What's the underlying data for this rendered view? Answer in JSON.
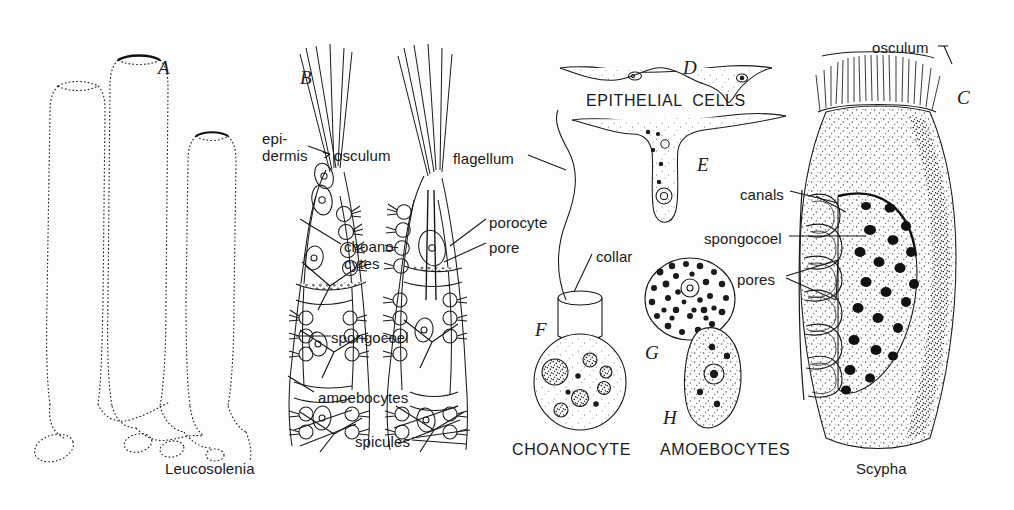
{
  "figure": {
    "background_color": "#fdfdfd",
    "ink_color": "#1a1a1a",
    "width": 1014,
    "height": 510
  },
  "panel_letters": [
    {
      "id": "A",
      "label": "A",
      "x": 158,
      "y": 58,
      "subject": "Leucosolenia colony habit"
    },
    {
      "id": "B",
      "label": "B",
      "x": 300,
      "y": 68,
      "subject": "Leucosolenia tube section"
    },
    {
      "id": "C",
      "label": "C",
      "x": 957,
      "y": 88,
      "subject": "Scypha whole animal"
    },
    {
      "id": "D",
      "label": "D",
      "x": 683,
      "y": 58,
      "subject": "Flat epithelial cell"
    },
    {
      "id": "E",
      "label": "E",
      "x": 697,
      "y": 155,
      "subject": "Epithelial cell with process"
    },
    {
      "id": "F",
      "label": "F",
      "x": 535,
      "y": 320,
      "subject": "Choanocyte"
    },
    {
      "id": "G",
      "label": "G",
      "x": 645,
      "y": 343,
      "subject": "Amoebocyte granular"
    },
    {
      "id": "H",
      "label": "H",
      "x": 663,
      "y": 408,
      "subject": "Amoebocyte nucleated"
    }
  ],
  "labels": [
    {
      "name": "epidermis",
      "text": "epi-\ndermis",
      "x": 262,
      "y": 130,
      "align": "left",
      "style": "two-line"
    },
    {
      "name": "osculum-b",
      "text": "osculum",
      "x": 334,
      "y": 148,
      "align": "left",
      "style": "plain"
    },
    {
      "name": "choanocytes",
      "text": "choano-\ncytes",
      "x": 344,
      "y": 238,
      "align": "left",
      "style": "two-line"
    },
    {
      "name": "spongocoel-b",
      "text": "spongocoel",
      "x": 331,
      "y": 330,
      "align": "left",
      "style": "plain"
    },
    {
      "name": "amoebocytes-b",
      "text": "amoebocytes",
      "x": 318,
      "y": 390,
      "align": "left",
      "style": "plain"
    },
    {
      "name": "spicules",
      "text": "spicules",
      "x": 355,
      "y": 434,
      "align": "left",
      "style": "plain"
    },
    {
      "name": "porocyte",
      "text": "porocyte",
      "x": 489,
      "y": 215,
      "align": "left",
      "style": "plain"
    },
    {
      "name": "pore",
      "text": "pore",
      "x": 489,
      "y": 240,
      "align": "left",
      "style": "plain"
    },
    {
      "name": "flagellum",
      "text": "flagellum",
      "x": 453,
      "y": 151,
      "align": "left",
      "style": "plain"
    },
    {
      "name": "collar",
      "text": "collar",
      "x": 596,
      "y": 249,
      "align": "left",
      "style": "plain"
    },
    {
      "name": "canals",
      "text": "canals",
      "x": 740,
      "y": 187,
      "align": "left",
      "style": "plain"
    },
    {
      "name": "spongocoel-c",
      "text": "spongocoel",
      "x": 704,
      "y": 231,
      "align": "left",
      "style": "plain"
    },
    {
      "name": "pores",
      "text": "pores",
      "x": 737,
      "y": 272,
      "align": "left",
      "style": "plain"
    },
    {
      "name": "osculum-c",
      "text": "osculum",
      "x": 872,
      "y": 40,
      "align": "left",
      "style": "plain"
    }
  ],
  "captions": [
    {
      "name": "epithelial-cells-caption",
      "text": "EPITHELIAL  CELLS",
      "x": 586,
      "y": 92,
      "style": "caps"
    },
    {
      "name": "choanocyte-caption",
      "text": "CHOANOCYTE",
      "x": 512,
      "y": 441,
      "style": "caps"
    },
    {
      "name": "amoebocytes-caption",
      "text": "AMOEBOCYTES",
      "x": 660,
      "y": 441,
      "style": "caps"
    },
    {
      "name": "leucosolenia-caption",
      "text": "Leucosolenia",
      "x": 165,
      "y": 461,
      "style": "species"
    },
    {
      "name": "scypha-caption",
      "text": "Scypha",
      "x": 856,
      "y": 461,
      "style": "species"
    }
  ],
  "leader_lines": [
    {
      "name": "leader-epidermis",
      "from": [
        308,
        146
      ],
      "to": [
        330,
        153
      ]
    },
    {
      "name": "leader-choanocytes",
      "from": [
        341,
        248
      ],
      "to": [
        300,
        222
      ]
    },
    {
      "name": "leader-spongocoel-b",
      "from": [
        329,
        337
      ],
      "to": [
        296,
        337
      ]
    },
    {
      "name": "leader-amoebocytes",
      "from": [
        316,
        396
      ],
      "to": [
        288,
        378
      ]
    },
    {
      "name": "leader-spicules",
      "from": [
        412,
        440
      ],
      "to": [
        470,
        432
      ]
    },
    {
      "name": "leader-porocyte",
      "from": [
        487,
        222
      ],
      "to": [
        452,
        248
      ]
    },
    {
      "name": "leader-pore",
      "from": [
        487,
        246
      ],
      "to": [
        448,
        262
      ]
    },
    {
      "name": "leader-flagellum",
      "from": [
        528,
        158
      ],
      "to": [
        565,
        172
      ]
    },
    {
      "name": "leader-collar",
      "from": [
        594,
        256
      ],
      "to": [
        578,
        286
      ]
    },
    {
      "name": "leader-canals",
      "from": [
        790,
        194
      ],
      "to": [
        836,
        205
      ]
    },
    {
      "name": "leader-spongocoel-c",
      "from": [
        789,
        238
      ],
      "to": [
        860,
        238
      ]
    },
    {
      "name": "leader-pores",
      "from": [
        786,
        279
      ],
      "to": [
        838,
        262
      ]
    },
    {
      "name": "leader-osculum-c",
      "from": [
        944,
        48
      ],
      "to": [
        952,
        66
      ]
    }
  ],
  "icon_names": [
    "sponge-colony-icon",
    "sponge-tube-section-icon",
    "epithelial-cell-icon",
    "choanocyte-icon",
    "amoebocyte-icon",
    "scypha-body-icon"
  ]
}
